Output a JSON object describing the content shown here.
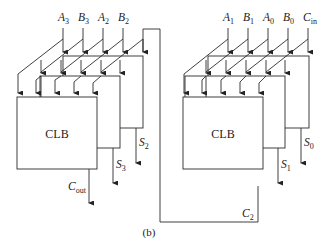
{
  "diagram": {
    "caption": "(b)",
    "left_stage": {
      "block_label": "CLB",
      "inputs": [
        {
          "name": "A",
          "sub": "3"
        },
        {
          "name": "B",
          "sub": "3"
        },
        {
          "name": "A",
          "sub": "2"
        },
        {
          "name": "B",
          "sub": "2"
        }
      ],
      "outputs": [
        {
          "name": "C",
          "sub": "out"
        },
        {
          "name": "S",
          "sub": "3"
        },
        {
          "name": "S",
          "sub": "2"
        }
      ]
    },
    "right_stage": {
      "block_label": "CLB",
      "inputs": [
        {
          "name": "A",
          "sub": "1"
        },
        {
          "name": "B",
          "sub": "1"
        },
        {
          "name": "A",
          "sub": "0"
        },
        {
          "name": "B",
          "sub": "0"
        },
        {
          "name": "C",
          "sub": "in"
        }
      ],
      "outputs": [
        {
          "name": "S",
          "sub": "1"
        },
        {
          "name": "S",
          "sub": "0"
        }
      ]
    },
    "carry_link": {
      "name": "C",
      "sub": "2"
    }
  }
}
